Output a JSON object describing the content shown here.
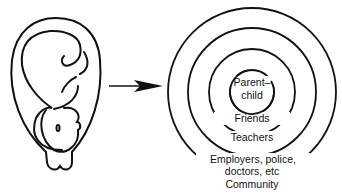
{
  "diagram": {
    "left_figure": "fetus-in-womb",
    "arrow": "right-arrow",
    "rings": [
      {
        "label": "Parent–child"
      },
      {
        "label": "Friends"
      },
      {
        "label": "Teachers"
      },
      {
        "label": "Employers, police, doctors, etc"
      },
      {
        "label": "Community"
      }
    ],
    "labels": {
      "parent_line1": "Parent–",
      "parent_line2": "child",
      "friends": "Friends",
      "teachers": "Teachers",
      "employers_line1": "Employers, police,",
      "employers_line2": "doctors, etc",
      "community": "Community"
    },
    "colors": {
      "stroke": "#111111",
      "background": "#ffffff"
    }
  }
}
